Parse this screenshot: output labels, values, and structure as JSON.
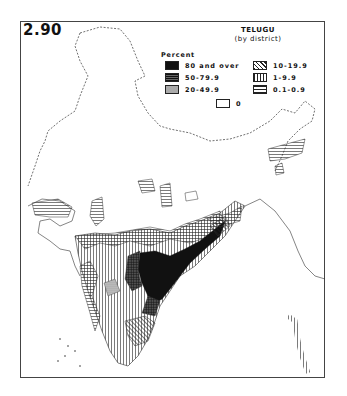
{
  "plate_number": "2.90",
  "title": "TELUGU",
  "subtitle": "(by district)",
  "legend": {
    "heading": "Percent",
    "classes": [
      {
        "label": "80 and over",
        "pattern": "solid-black"
      },
      {
        "label": "50-79.9",
        "pattern": "cross-hatch"
      },
      {
        "label": "20-49.9",
        "pattern": "fine-dots"
      },
      {
        "label": "10-19.9",
        "pattern": "diagonal-lines"
      },
      {
        "label": "1-9.9",
        "pattern": "vertical-lines"
      },
      {
        "label": "0.1-0.9",
        "pattern": "horizontal-lines"
      },
      {
        "label": "0",
        "pattern": "blank"
      }
    ]
  },
  "map": {
    "subject": "India",
    "language": "Telugu",
    "unit": "district",
    "highest_concentration_region": "Andhra Pradesh (south-east peninsula)"
  }
}
